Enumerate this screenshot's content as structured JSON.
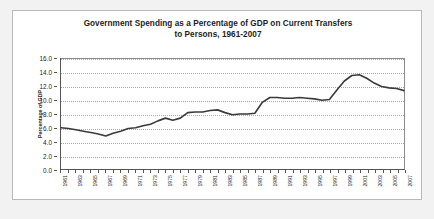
{
  "chart_data": {
    "type": "line",
    "title": "Government Spending as a Percentage of GDP on Current Transfers to Persons, 1961-2007",
    "title_lines": [
      "Government Spending as a Percentage of GDP on Current Transfers",
      "to Persons, 1961-2007"
    ],
    "xlabel": "",
    "ylabel": "Percentage of GDP",
    "ylim": [
      0.0,
      16.0
    ],
    "ytick_step": 2.0,
    "ytick_labels": [
      "0.0",
      "2.0",
      "4.0",
      "6.0",
      "8.0",
      "10.0",
      "12.0",
      "14.0",
      "16.0"
    ],
    "ytick_values": [
      0.0,
      2.0,
      4.0,
      6.0,
      8.0,
      10.0,
      12.0,
      14.0,
      16.0
    ],
    "grid": true,
    "grid_axis": "y",
    "grid_style": "dotted",
    "legend": false,
    "legend_position": "none",
    "line_color": "#3a3a3a",
    "line_width": 1.6,
    "xlim": [
      1961,
      2007
    ],
    "xtick_labels": [
      "1961",
      "1963",
      "1965",
      "1967",
      "1969",
      "1971",
      "1973",
      "1975",
      "1977",
      "1979",
      "1981",
      "1983",
      "1985",
      "1987",
      "1989",
      "1991",
      "1993",
      "1995",
      "1997",
      "1999",
      "2001",
      "2003",
      "2005",
      "2007"
    ],
    "xtick_values": [
      1961,
      1963,
      1965,
      1967,
      1969,
      1971,
      1973,
      1975,
      1977,
      1979,
      1981,
      1983,
      1985,
      1987,
      1989,
      1991,
      1993,
      1995,
      1997,
      1999,
      2001,
      2003,
      2005,
      2007
    ],
    "x": [
      1961,
      1962,
      1963,
      1964,
      1965,
      1966,
      1967,
      1968,
      1969,
      1970,
      1971,
      1972,
      1973,
      1974,
      1975,
      1976,
      1977,
      1978,
      1979,
      1980,
      1981,
      1982,
      1983,
      1984,
      1985,
      1986,
      1987,
      1988,
      1989,
      1990,
      1991,
      1992,
      1993,
      1994,
      1995,
      1996,
      1997,
      1998,
      1999,
      2000,
      2001,
      2002,
      2003,
      2004,
      2005,
      2006,
      2007
    ],
    "values": [
      6.0,
      5.9,
      5.7,
      5.5,
      5.3,
      5.1,
      4.8,
      5.2,
      5.5,
      5.9,
      6.0,
      6.3,
      6.5,
      7.0,
      7.4,
      7.1,
      7.4,
      8.2,
      8.3,
      8.3,
      8.5,
      8.6,
      8.2,
      7.9,
      8.0,
      8.0,
      8.1,
      9.7,
      10.4,
      10.4,
      10.3,
      10.3,
      10.4,
      10.3,
      10.2,
      10.0,
      10.1,
      11.5,
      12.8,
      13.6,
      13.7,
      13.2,
      12.5,
      12.0,
      11.8,
      11.7,
      11.4
    ],
    "series_note_values_tail": [
      10.5,
      10.9,
      10.8,
      10.6,
      10.4,
      10.3,
      10.2,
      10.3,
      10.4
    ]
  }
}
